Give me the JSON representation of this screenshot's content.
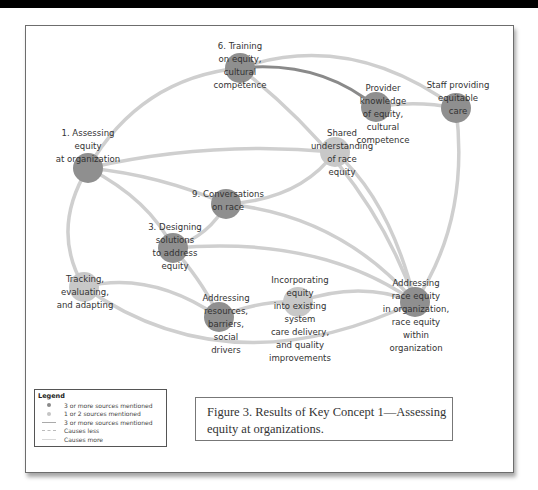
{
  "figure": {
    "caption": "Figure 3. Results of Key Concept 1—Assessing equity at organizations."
  },
  "colors": {
    "node_dark": "#8f8f8f",
    "node_light": "#c8c8c8",
    "edge": "#cfcfcf",
    "edge_strong": "#8a8a8a"
  },
  "legend": {
    "title": "Legend",
    "items": [
      {
        "symbol": "dark-dot",
        "label": "3 or more sources mentioned"
      },
      {
        "symbol": "light-dot",
        "label": "1 or 2 sources mentioned"
      },
      {
        "symbol": "solid-line",
        "label": "3 or more sources mentioned"
      },
      {
        "symbol": "dashed-line",
        "label": "Causes less"
      },
      {
        "symbol": "light-line",
        "label": "Causes more"
      }
    ]
  },
  "nodes": [
    {
      "id": "assessing",
      "lines": [
        "1. Assessing",
        "equity",
        "at organization"
      ],
      "sources": "3+"
    },
    {
      "id": "training",
      "lines": [
        "6. Training",
        "on equity,",
        "cultural",
        "competence"
      ],
      "sources": "3+"
    },
    {
      "id": "provider",
      "lines": [
        "Provider",
        "knowledge",
        "of equity,",
        "cultural",
        "competence"
      ],
      "sources": "3+"
    },
    {
      "id": "staff",
      "lines": [
        "Staff providing",
        "equitable",
        "care"
      ],
      "sources": "3+"
    },
    {
      "id": "shared",
      "lines": [
        "Shared",
        "understanding",
        "of race",
        "equity"
      ],
      "sources": "1-2"
    },
    {
      "id": "conversations",
      "lines": [
        "9. Conversations",
        "on race"
      ],
      "sources": "3+"
    },
    {
      "id": "designing",
      "lines": [
        "3. Designing",
        "solutions",
        "to address",
        "equity"
      ],
      "sources": "3+"
    },
    {
      "id": "tracking",
      "lines": [
        "Tracking,",
        "evaluating,",
        "and adapting"
      ],
      "sources": "1-2"
    },
    {
      "id": "resources",
      "lines": [
        "Addressing",
        "resources,",
        "barriers,",
        "social",
        "drivers"
      ],
      "sources": "3+"
    },
    {
      "id": "incorporating",
      "lines": [
        "Incorporating",
        "equity",
        "into existing",
        "system",
        "care delivery,",
        "and quality",
        "improvements"
      ],
      "sources": "1-2"
    },
    {
      "id": "race_equity",
      "lines": [
        "Addressing",
        "race equity",
        "in organization,",
        "race equity",
        "within",
        "organization"
      ],
      "sources": "3+"
    }
  ],
  "edges": [
    {
      "from": "assessing",
      "to": "training",
      "type": "causes-more"
    },
    {
      "from": "assessing",
      "to": "shared",
      "type": "causes-more"
    },
    {
      "from": "assessing",
      "to": "conversations",
      "type": "causes-more"
    },
    {
      "from": "assessing",
      "to": "designing",
      "type": "causes-more"
    },
    {
      "from": "assessing",
      "to": "tracking",
      "type": "causes-more"
    },
    {
      "from": "training",
      "to": "provider",
      "type": "3+ sources"
    },
    {
      "from": "training",
      "to": "staff",
      "type": "causes-more"
    },
    {
      "from": "training",
      "to": "race_equity",
      "type": "causes-more"
    },
    {
      "from": "provider",
      "to": "staff",
      "type": "causes-more"
    },
    {
      "from": "staff",
      "to": "race_equity",
      "type": "causes-more"
    },
    {
      "from": "shared",
      "to": "conversations",
      "type": "causes-more"
    },
    {
      "from": "shared",
      "to": "race_equity",
      "type": "causes-more"
    },
    {
      "from": "conversations",
      "to": "designing",
      "type": "causes-more"
    },
    {
      "from": "conversations",
      "to": "race_equity",
      "type": "causes-more"
    },
    {
      "from": "designing",
      "to": "resources",
      "type": "causes-more"
    },
    {
      "from": "designing",
      "to": "race_equity",
      "type": "causes-more"
    },
    {
      "from": "tracking",
      "to": "resources",
      "type": "causes-more"
    },
    {
      "from": "tracking",
      "to": "race_equity",
      "type": "causes-more"
    },
    {
      "from": "resources",
      "to": "incorporating",
      "type": "causes-more"
    },
    {
      "from": "incorporating",
      "to": "race_equity",
      "type": "causes-more"
    }
  ]
}
